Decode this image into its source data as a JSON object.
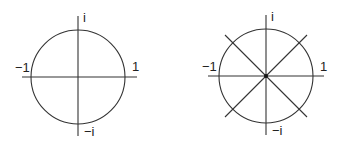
{
  "diagrams": [
    {
      "name": "unit-circle",
      "center": [
        78,
        77
      ],
      "radius": 47,
      "axes": true,
      "diagonals": false,
      "labels": {
        "top": "i",
        "bottom": "−i",
        "left": "−1",
        "right": "1"
      }
    },
    {
      "name": "unit-circle-eighth-roots",
      "center": [
        266,
        76
      ],
      "radius": 47,
      "axes": true,
      "diagonals": true,
      "center_dot": true,
      "labels": {
        "top": "i",
        "bottom": "−i",
        "left": "−1",
        "right": "1"
      }
    }
  ],
  "colors": {
    "stroke": "#333333",
    "text": "#222222",
    "background": "#ffffff"
  }
}
